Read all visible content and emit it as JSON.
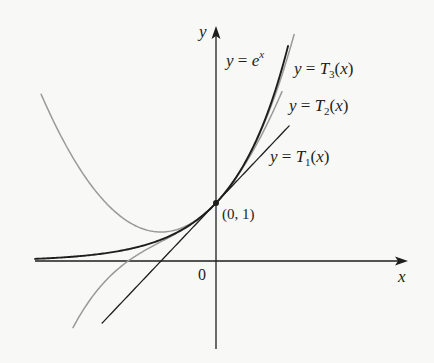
{
  "chart_data": {
    "type": "line",
    "title": "",
    "xlabel": "x",
    "ylabel": "y",
    "origin_label": "0",
    "grid": false,
    "legend": "inline labels",
    "xlim": [
      -3.3,
      3.5
    ],
    "ylim": [
      -1.5,
      4.0
    ],
    "series": [
      {
        "name": "y = e^x",
        "function": "exp(x)",
        "domain": [
          -3.29,
          1.31
        ],
        "color": "#1e1e1e",
        "width": 1.9
      },
      {
        "name": "y = T1(x)",
        "function": "1 + x",
        "domain": [
          -2.07,
          1.33
        ],
        "color": "#1e1e1e",
        "width": 1.3
      },
      {
        "name": "y = T2(x)",
        "function": "1 + x + x^2/2",
        "domain": [
          -3.18,
          1.2
        ],
        "color": "#9a9a9a",
        "width": 1.5
      },
      {
        "name": "y = T3(x)",
        "function": "1 + x + x^2/2 + x^3/6",
        "domain": [
          -2.6,
          1.42
        ],
        "color": "#9a9a9a",
        "width": 1.5
      }
    ],
    "annotations": [
      {
        "text": "(0, 1)",
        "x": 0,
        "y": 1,
        "marker": "dot"
      }
    ]
  },
  "labels": {
    "y_axis": "y",
    "x_axis": "x",
    "origin": "0",
    "point": "(0, 1)",
    "ex": {
      "lhs": "y",
      "eq": " = ",
      "base": "e",
      "exp": "x"
    },
    "t3": {
      "lhs": "y",
      "eq": " = ",
      "fn": "T",
      "sub": "3",
      "arg": "(",
      "var": "x",
      "close": ")"
    },
    "t2": {
      "lhs": "y",
      "eq": " = ",
      "fn": "T",
      "sub": "2",
      "arg": "(",
      "var": "x",
      "close": ")"
    },
    "t1": {
      "lhs": "y",
      "eq": " = ",
      "fn": "T",
      "sub": "1",
      "arg": "(",
      "var": "x",
      "close": ")"
    }
  },
  "colors": {
    "background": "#f8f8f6",
    "ink": "#1e1e1e",
    "gray_curve": "#9a9a9a"
  }
}
